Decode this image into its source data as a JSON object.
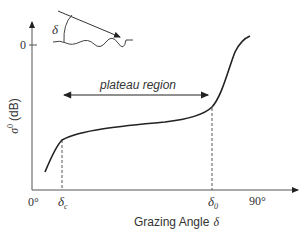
{
  "diagram": {
    "title": "",
    "y_axis": {
      "label_symbol": "σ",
      "label_superscript": "0",
      "label_unit": "(dB)",
      "tick_label": "0"
    },
    "x_axis": {
      "label": "Grazing Angle",
      "label_symbol": "δ",
      "tick_labels": {
        "origin": "0°",
        "critical": "δ",
        "critical_sub": "c",
        "transition": "δ",
        "transition_sub": "0",
        "end": "90°"
      }
    },
    "annotation": {
      "plateau_label": "plateau region"
    },
    "inset": {
      "angle_symbol": "δ",
      "description": "incident ray at grazing angle onto rough surface"
    },
    "colors": {
      "line": "#222222",
      "axis": "#555555",
      "text": "#333333"
    }
  }
}
